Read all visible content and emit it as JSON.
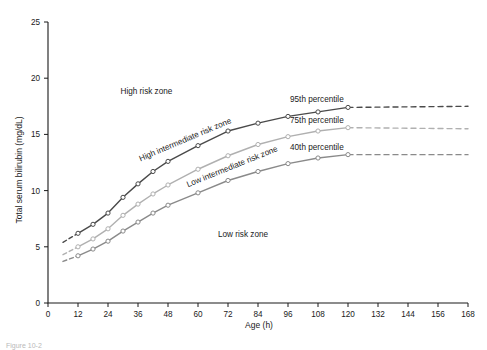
{
  "chart_data": {
    "type": "line",
    "title": "",
    "xlabel": "Age (h)",
    "ylabel": "Total serum bilirubin (mg/dL)",
    "xlim": [
      0,
      168
    ],
    "ylim": [
      0,
      25
    ],
    "xticks": [
      0,
      12,
      24,
      36,
      48,
      60,
      72,
      84,
      96,
      108,
      120,
      132,
      144,
      156,
      168
    ],
    "yticks": [
      0,
      5,
      10,
      15,
      20,
      25
    ],
    "grid": false,
    "legend_position": "inline-right",
    "series": [
      {
        "name": "95th percentile",
        "color": "#4a4a4a",
        "x": [
          12,
          18,
          24,
          30,
          36,
          42,
          48,
          60,
          72,
          84,
          96,
          108,
          120
        ],
        "values": [
          6.2,
          7.0,
          8.0,
          9.4,
          10.6,
          11.7,
          12.6,
          14.0,
          15.3,
          16.0,
          16.6,
          17.0,
          17.4
        ],
        "lead_dash": {
          "x": [
            6,
            12
          ],
          "values": [
            5.4,
            6.2
          ]
        },
        "trail_dash": {
          "x": [
            120,
            168
          ],
          "values": [
            17.4,
            17.5
          ]
        }
      },
      {
        "name": "75th percentile",
        "color": "#b0b0b0",
        "x": [
          12,
          18,
          24,
          30,
          36,
          42,
          48,
          60,
          72,
          84,
          96,
          108,
          120
        ],
        "values": [
          5.0,
          5.7,
          6.6,
          7.8,
          8.8,
          9.7,
          10.5,
          11.9,
          13.1,
          14.1,
          14.8,
          15.3,
          15.6
        ],
        "lead_dash": {
          "x": [
            6,
            12
          ],
          "values": [
            4.3,
            5.0
          ]
        },
        "trail_dash": {
          "x": [
            120,
            168
          ],
          "values": [
            15.6,
            15.5
          ]
        }
      },
      {
        "name": "40th percentile",
        "color": "#8a8a8a",
        "x": [
          12,
          18,
          24,
          30,
          36,
          42,
          48,
          60,
          72,
          84,
          96,
          108,
          120
        ],
        "values": [
          4.2,
          4.8,
          5.5,
          6.4,
          7.2,
          8.0,
          8.7,
          9.8,
          10.9,
          11.7,
          12.4,
          12.9,
          13.2
        ],
        "lead_dash": {
          "x": [
            6,
            12
          ],
          "values": [
            3.7,
            4.2
          ]
        },
        "trail_dash": {
          "x": [
            120,
            168
          ],
          "values": [
            13.2,
            13.2
          ]
        }
      }
    ],
    "annotations": [
      {
        "text": "High risk zone",
        "x_h": 29,
        "y_val": 18.6,
        "rotation": 0
      },
      {
        "text": "High intermediate risk zone",
        "x_h": 37,
        "y_val": 12.6,
        "rotation": -23
      },
      {
        "text": "Low intermediate risk zone",
        "x_h": 56,
        "y_val": 10.3,
        "rotation": -22
      },
      {
        "text": "Low risk zone",
        "x_h": 68,
        "y_val": 5.9,
        "rotation": 0
      }
    ]
  }
}
